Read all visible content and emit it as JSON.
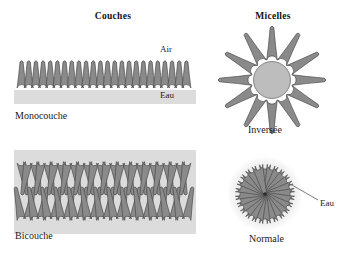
{
  "figure": {
    "background_color": "#ffffff",
    "lipid_fill": "#8a8a8a",
    "lipid_stroke": "#4a4a4a",
    "core_fill": "#bdbdbd",
    "water_band_fill": "#dcdcdc",
    "halo_fill": "#e2e2e2",
    "leader_line_color": "#5a5a5a"
  },
  "columns": [
    {
      "id": "couches",
      "title": "Couches"
    },
    {
      "id": "micelles",
      "title": "Micelles"
    }
  ],
  "annotations": {
    "air": "Air",
    "eau_monolayer": "Eau",
    "eau_micelle": "Eau"
  },
  "structures": [
    {
      "id": "monolayer",
      "label": "Monocouche",
      "type": "monolayer",
      "lipid_count": 24,
      "x": 18,
      "y": 52,
      "width": 172,
      "height": 44,
      "head_radius": 4.6,
      "tail_length": 26,
      "orientation": "heads-down-tails-up"
    },
    {
      "id": "bilayer",
      "label": "Bicouche",
      "type": "bilayer",
      "lipid_count_per_leaflet": 26,
      "x": 18,
      "y": 158,
      "width": 172,
      "height": 66,
      "head_radius": 4.4,
      "tail_length": 24,
      "orientation": "heads-outward-tails-interdigitated"
    },
    {
      "id": "inverse-micelle",
      "label": "Inversée",
      "type": "inverted-micelle",
      "arm_count": 12,
      "center_x": 272,
      "center_y": 80,
      "core_radius": 17,
      "head_radius": 5.4,
      "tail_length": 30,
      "orientation": "heads-inward-tails-outward"
    },
    {
      "id": "normal-micelle",
      "label": "Normale",
      "type": "normal-micelle",
      "lipid_count": 24,
      "center_x": 265,
      "center_y": 194,
      "outer_radius": 30,
      "head_radius": 5.6,
      "tail_length": 24,
      "orientation": "heads-outward-tails-inward",
      "halo_radius": 38
    }
  ],
  "leader_line": {
    "from_x": 292,
    "from_y": 185,
    "to_x": 318,
    "to_y": 200
  }
}
